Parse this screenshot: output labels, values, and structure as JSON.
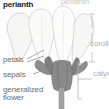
{
  "figure": {
    "background_color": "#fdfdfd",
    "width": 109,
    "height": 109
  },
  "labels": {
    "perianth_main": "perianth",
    "perianth_top": "perianth",
    "petals": "petals",
    "sepals": "sepals",
    "generalized_line1": "generalized",
    "generalized_line2": "flower",
    "corolla": "corolla",
    "calyx": "calyx"
  },
  "colors": {
    "text_dark": "#1b1b1b",
    "text_gray": "#6f6f6f",
    "text_light": "#b4b4b4",
    "petal_fill": "#f7f7f5",
    "petal_edge": "#cfcfcf",
    "sepal_fill": "#8e8e8e",
    "sepal_dark": "#6e6e6e",
    "stem_fill": "#a5a5a5",
    "leader_line": "#8a8a8a",
    "bracket_line": "#b9b9b9"
  },
  "parts": [
    {
      "name": "petals",
      "region": "upper",
      "shade": "pale"
    },
    {
      "name": "sepals",
      "region": "lower",
      "shade": "gray"
    },
    {
      "name": "corolla",
      "region": "upper bracket",
      "shade": "pale"
    },
    {
      "name": "calyx",
      "region": "lower bracket",
      "shade": "gray"
    },
    {
      "name": "stem",
      "region": "base",
      "shade": "gray"
    }
  ],
  "icons": {
    "flower": "flower-illustration",
    "bracket_corolla": "vertical-bracket-icon",
    "bracket_calyx": "square-bracket-icon"
  }
}
